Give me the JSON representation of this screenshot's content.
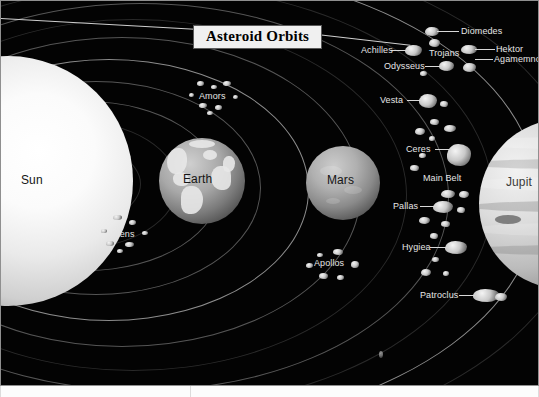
{
  "figure": {
    "title": "Asteroid Orbits",
    "background_color": "#030303",
    "label_color": "#e6e6e6",
    "title_box_color": "#f0f0f0",
    "title_text_color": "#000000",
    "frame_border_color": "#8f8f8f"
  },
  "bodies": [
    {
      "id": "sun",
      "name": "Sun",
      "label_color": "#151515"
    },
    {
      "id": "earth",
      "name": "Earth",
      "label_color": "#151515"
    },
    {
      "id": "mars",
      "name": "Mars",
      "label_color": "#151515"
    },
    {
      "id": "jupiter",
      "name": "Jupit",
      "label_color": "#3a3a3a"
    }
  ],
  "groups": [
    {
      "id": "atens",
      "name": "Atens"
    },
    {
      "id": "amors",
      "name": "Amors"
    },
    {
      "id": "apollos",
      "name": "Apollos"
    },
    {
      "id": "mainbelt",
      "name": "Main Belt"
    },
    {
      "id": "trojans",
      "name": "Trojans"
    }
  ],
  "asteroids": [
    {
      "id": "diomedes",
      "name": "Diomedes"
    },
    {
      "id": "hektor",
      "name": "Hektor"
    },
    {
      "id": "achilles",
      "name": "Achilles"
    },
    {
      "id": "odysseus",
      "name": "Odysseus"
    },
    {
      "id": "agamemnon",
      "name": "Agamemnon"
    },
    {
      "id": "vesta",
      "name": "Vesta"
    },
    {
      "id": "ceres",
      "name": "Ceres"
    },
    {
      "id": "pallas",
      "name": "Pallas"
    },
    {
      "id": "hygiea",
      "name": "Hygiea"
    },
    {
      "id": "patroclus",
      "name": "Patroclus"
    }
  ]
}
